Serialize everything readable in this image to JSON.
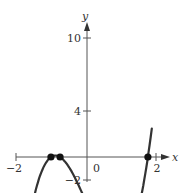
{
  "chart_data": {
    "type": "line",
    "title": "",
    "xlabel": "x",
    "ylabel": "y",
    "xlim": [
      -2,
      2.3
    ],
    "ylim": [
      -2,
      10.5
    ],
    "grid": false,
    "x_ticks": [
      {
        "value": -2,
        "label": "−2"
      },
      {
        "value": 2,
        "label": "2"
      }
    ],
    "y_ticks": [
      {
        "value": 10,
        "label": "10"
      },
      {
        "value": 4,
        "label": "4"
      },
      {
        "value": -2,
        "label": "−2"
      }
    ],
    "origin_label": "0",
    "series": [
      {
        "name": "f(x)",
        "color": "#333333",
        "x": [
          -1.83,
          -1.6,
          -1.4,
          -1.2,
          -1.03,
          -0.9,
          -0.77,
          -0.5,
          -0.25,
          0,
          0.25,
          0.5,
          0.75,
          0.86,
          1.0,
          1.25,
          1.5,
          1.74,
          1.85
        ],
        "y": [
          10,
          6.0,
          3.1,
          1.0,
          0,
          -0.2,
          0,
          1.2,
          2.7,
          4.0,
          5.5,
          6.9,
          7.8,
          7.9,
          7.7,
          6.3,
          3.5,
          0,
          -1.9
        ]
      }
    ],
    "marked_points": [
      {
        "x": -1.03,
        "y": 0,
        "label": ""
      },
      {
        "x": -0.77,
        "y": 0,
        "label": ""
      },
      {
        "x": 1.74,
        "y": 0,
        "label": ""
      }
    ]
  }
}
